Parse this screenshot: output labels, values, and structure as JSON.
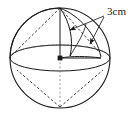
{
  "figure": {
    "name": "sphere-with-radius-dimension",
    "type": "geometry-diagram",
    "background_color": "#ffffff",
    "stroke_color": "#1a1a1a",
    "dimensions": {
      "width": 140,
      "height": 117
    },
    "labels": {
      "radius": "3cm"
    },
    "geometry": {
      "sphere_center": [
        60,
        58
      ],
      "sphere_radius": 50,
      "equator_rx": 50,
      "equator_ry": 13,
      "top_pole": [
        60,
        8
      ],
      "bottom_pole": [
        60,
        108
      ],
      "leader_origin": [
        105,
        17
      ],
      "arrow_target_upper": [
        68,
        31
      ],
      "arrow_target_lower": [
        89,
        45
      ]
    }
  }
}
